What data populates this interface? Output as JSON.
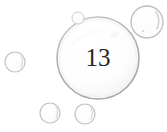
{
  "scene": {
    "title": "bubbles-illustration",
    "width": 167,
    "height": 132,
    "background_color": "#ffffff"
  },
  "colors": {
    "background": "#ffffff",
    "bubble_outline": "#b9b7b7",
    "bubble_outline_light": "#cfcdcd",
    "bubble_fill": "#fdfdfd",
    "highlight": "#ffffff",
    "number_color": "#262626",
    "shadow": "#d8d6d6"
  },
  "main_bubble": {
    "label": "main-bubble",
    "number": "13",
    "center_x": 98,
    "center_y": 58,
    "radius": 41,
    "outline_color": "#b9b7b7",
    "has_highlight": true
  },
  "small_bubbles": [
    {
      "label": "bubble-top-right",
      "center_x": 147,
      "center_y": 22,
      "radius": 16,
      "outline_color": "#c2c0c0"
    },
    {
      "label": "bubble-top-tiny",
      "center_x": 78,
      "center_y": 18,
      "radius": 6,
      "outline_color": "#cfcdcd"
    },
    {
      "label": "bubble-left",
      "center_x": 15,
      "center_y": 62,
      "radius": 10,
      "outline_color": "#c6c4c4"
    },
    {
      "label": "bubble-bottom-left",
      "center_x": 50,
      "center_y": 113,
      "radius": 10,
      "outline_color": "#c2c0c0"
    },
    {
      "label": "bubble-bottom-right",
      "center_x": 85,
      "center_y": 114,
      "radius": 10,
      "outline_color": "#c2c0c0"
    }
  ]
}
